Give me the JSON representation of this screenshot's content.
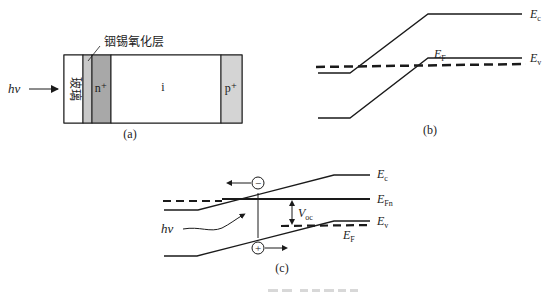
{
  "panel_a": {
    "caption": "(a)",
    "light_label": "hν",
    "ito_label": "铟锡氧化层",
    "layers": [
      {
        "id": "glass",
        "label": "玻璃",
        "color": "#ffffff"
      },
      {
        "id": "ito",
        "label": "",
        "color": "#c8c8c8"
      },
      {
        "id": "n_plus",
        "label": "n⁺",
        "color": "#a8a8a8"
      },
      {
        "id": "i",
        "label": "i",
        "color": "#ffffff"
      },
      {
        "id": "p_plus",
        "label": "p⁺",
        "color": "#d4d4d4"
      }
    ]
  },
  "panel_b": {
    "caption": "(b)",
    "ec_label": "E",
    "ec_sub": "c",
    "ev_label": "E",
    "ev_sub": "v",
    "ef_label": "E",
    "ef_sub": "F"
  },
  "panel_c": {
    "caption": "(c)",
    "light_label": "hν",
    "ec_label": "E",
    "ec_sub": "c",
    "efn_label": "E",
    "efn_sub": "Fn",
    "ev_label": "E",
    "ev_sub": "v",
    "ef_label": "E",
    "ef_sub": "F",
    "voc_label": "V",
    "voc_sub": "oc",
    "electron_symbol": "−",
    "hole_symbol": "+"
  },
  "colors": {
    "line": "#1a1a1a",
    "background": "#ffffff"
  }
}
